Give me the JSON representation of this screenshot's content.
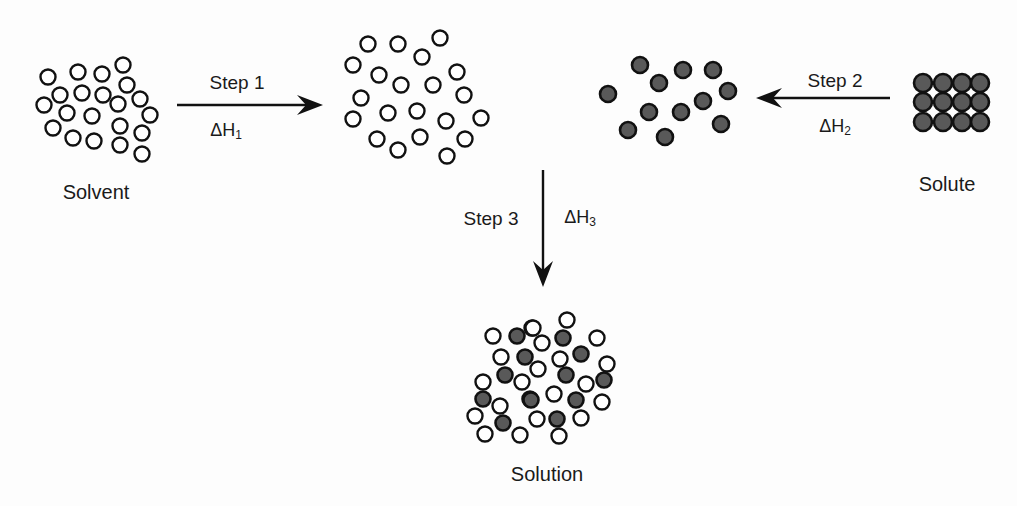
{
  "diagram": {
    "colors": {
      "stroke": "#111111",
      "solute_fill": "#595959",
      "solvent_fill": "#ffffff",
      "background": "#fdfdfd"
    },
    "labels": {
      "solvent": {
        "text": "Solvent",
        "x": 96,
        "y": 192
      },
      "solute": {
        "text": "Solute",
        "x": 947,
        "y": 184
      },
      "solution": {
        "text": "Solution",
        "x": 547,
        "y": 474
      }
    },
    "steps": [
      {
        "id": "step1",
        "label": "Step 1",
        "label_x": 237,
        "label_y": 82,
        "delta_symbol": "ΔH",
        "delta_sub": "1",
        "delta_x": 226,
        "delta_y": 131,
        "arrow": {
          "x1": 177,
          "y1": 105,
          "x2": 323,
          "y2": 105,
          "direction": "right"
        }
      },
      {
        "id": "step2",
        "label": "Step 2",
        "label_x": 835,
        "label_y": 80,
        "delta_symbol": "ΔH",
        "delta_sub": "2",
        "delta_x": 835,
        "delta_y": 127,
        "arrow": {
          "x1": 890,
          "y1": 98,
          "x2": 756,
          "y2": 98,
          "direction": "left"
        }
      },
      {
        "id": "step3",
        "label": "Step 3",
        "label_x": 491,
        "label_y": 218,
        "delta_symbol": "ΔH",
        "delta_sub": "3",
        "delta_x": 580,
        "delta_y": 218,
        "arrow": {
          "x1": 543,
          "y1": 170,
          "x2": 543,
          "y2": 287,
          "direction": "down"
        }
      }
    ],
    "groups": {
      "solvent": {
        "type": "open",
        "r": 7.5,
        "points": [
          [
            48,
            77
          ],
          [
            78,
            72
          ],
          [
            102,
            74
          ],
          [
            123,
            65
          ],
          [
            60,
            95
          ],
          [
            82,
            93
          ],
          [
            103,
            95
          ],
          [
            127,
            85
          ],
          [
            44,
            105
          ],
          [
            67,
            113
          ],
          [
            92,
            116
          ],
          [
            118,
            104
          ],
          [
            140,
            99
          ],
          [
            150,
            115
          ],
          [
            53,
            128
          ],
          [
            73,
            138
          ],
          [
            94,
            141
          ],
          [
            120,
            126
          ],
          [
            120,
            145
          ],
          [
            142,
            133
          ],
          [
            142,
            154
          ]
        ]
      },
      "separated_solvent": {
        "type": "open",
        "r": 7.5,
        "points": [
          [
            368,
            44
          ],
          [
            398,
            44
          ],
          [
            440,
            38
          ],
          [
            422,
            57
          ],
          [
            353,
            65
          ],
          [
            379,
            75
          ],
          [
            401,
            85
          ],
          [
            433,
            85
          ],
          [
            457,
            72
          ],
          [
            361,
            98
          ],
          [
            464,
            95
          ],
          [
            353,
            119
          ],
          [
            388,
            113
          ],
          [
            417,
            111
          ],
          [
            446,
            121
          ],
          [
            481,
            118
          ],
          [
            377,
            139
          ],
          [
            420,
            137
          ],
          [
            398,
            150
          ],
          [
            465,
            139
          ],
          [
            447,
            156
          ]
        ]
      },
      "separated_solute": {
        "type": "filled",
        "r": 8,
        "points": [
          [
            640,
            65
          ],
          [
            683,
            70
          ],
          [
            713,
            70
          ],
          [
            659,
            83
          ],
          [
            608,
            94
          ],
          [
            728,
            91
          ],
          [
            703,
            101
          ],
          [
            649,
            112
          ],
          [
            681,
            112
          ],
          [
            628,
            130
          ],
          [
            665,
            137
          ],
          [
            721,
            124
          ]
        ]
      },
      "solute_crystal": {
        "type": "filled",
        "r": 9,
        "cols": [
          923,
          943,
          962,
          980
        ],
        "rows": [
          83,
          102,
          122
        ]
      },
      "solution": {
        "r": 7.5,
        "open": [
          [
            493,
            336
          ],
          [
            532,
            328
          ],
          [
            501,
            357
          ],
          [
            483,
            382
          ],
          [
            522,
            382
          ],
          [
            500,
            406
          ],
          [
            475,
            416
          ],
          [
            485,
            434
          ],
          [
            520,
            435
          ],
          [
            533,
            328
          ],
          [
            542,
            343
          ],
          [
            567,
            320
          ],
          [
            597,
            338
          ],
          [
            560,
            359
          ],
          [
            538,
            369
          ],
          [
            607,
            364
          ],
          [
            586,
            384
          ],
          [
            554,
            394
          ],
          [
            602,
            402
          ],
          [
            537,
            419
          ],
          [
            581,
            418
          ],
          [
            559,
            436
          ]
        ],
        "filled": [
          [
            517,
            336
          ],
          [
            525,
            357
          ],
          [
            505,
            375
          ],
          [
            483,
            399
          ],
          [
            530,
            399
          ],
          [
            503,
            423
          ],
          [
            563,
            338
          ],
          [
            581,
            354
          ],
          [
            566,
            375
          ],
          [
            604,
            380
          ],
          [
            531,
            400
          ],
          [
            576,
            400
          ],
          [
            557,
            419
          ]
        ]
      }
    }
  }
}
